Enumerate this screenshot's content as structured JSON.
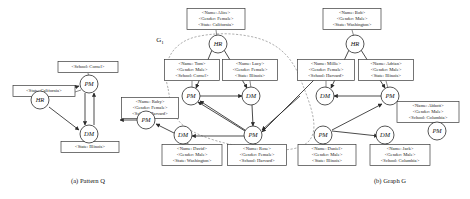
{
  "figure": {
    "panels": [
      {
        "id": "pattern",
        "caption": "(a) Pattern Q"
      },
      {
        "id": "graph",
        "caption": "(b) Graph G"
      }
    ],
    "region_label": "G",
    "region_label_sub": "1"
  },
  "pattern": {
    "nodes": [
      {
        "id": "p_hr",
        "label": "HR",
        "cx": 40,
        "cy": 100
      },
      {
        "id": "p_pm",
        "label": "PM",
        "cx": 89,
        "cy": 84
      },
      {
        "id": "p_dm",
        "label": "DM",
        "cx": 89,
        "cy": 134
      }
    ],
    "boxes": [
      {
        "id": "p_box_school",
        "cx": 88,
        "cy": 67,
        "w": 60,
        "h": 11,
        "lines": [
          "<School: Cornel>"
        ]
      },
      {
        "id": "p_box_state_ca",
        "cx": 44,
        "cy": 91,
        "w": 62,
        "h": 11,
        "lines": [
          "<State: California>"
        ]
      },
      {
        "id": "p_box_state_il",
        "cx": 90,
        "cy": 147,
        "w": 58,
        "h": 11,
        "lines": [
          "<State: Illinois>"
        ]
      }
    ]
  },
  "graph": {
    "nodes": [
      {
        "id": "g_hr1",
        "label": "HR",
        "sub": "",
        "cx": 218,
        "cy": 44
      },
      {
        "id": "g_pm1",
        "label": "PM",
        "sub": "",
        "cx": 191,
        "cy": 96
      },
      {
        "id": "g_dm1",
        "label": "DM",
        "sub": "",
        "cx": 251,
        "cy": 96
      },
      {
        "id": "g_pm2",
        "label": "PM",
        "sub": "",
        "cx": 253,
        "cy": 135
      },
      {
        "id": "g_dm2",
        "label": "DM",
        "sub": "",
        "cx": 183,
        "cy": 135
      },
      {
        "id": "g_pm3",
        "label": "PM",
        "sub": "",
        "cx": 146,
        "cy": 120
      },
      {
        "id": "g_hr2",
        "label": "HR",
        "sub": "",
        "cx": 355,
        "cy": 44
      },
      {
        "id": "g_dm3",
        "label": "DM",
        "sub": "",
        "cx": 325,
        "cy": 96
      },
      {
        "id": "g_pm4",
        "label": "PM",
        "sub": "",
        "cx": 390,
        "cy": 96
      },
      {
        "id": "g_pm5",
        "label": "PM",
        "sub": "",
        "cx": 323,
        "cy": 135
      },
      {
        "id": "g_dm4",
        "label": "DM",
        "sub": "",
        "cx": 385,
        "cy": 135
      },
      {
        "id": "g_pm6",
        "label": "PM",
        "sub": "",
        "cx": 437,
        "cy": 131
      }
    ],
    "boxes": [
      {
        "id": "g_box_alice",
        "cx": 216,
        "cy": 19,
        "w": 58,
        "h": 21,
        "lines": [
          "<Name: Alice>",
          "<Gender: Female>",
          "<State: California>"
        ]
      },
      {
        "id": "g_box_tom",
        "cx": 192,
        "cy": 70,
        "w": 55,
        "h": 21,
        "lines": [
          "<Name: Tom>",
          "<Gender: Male>",
          "<School: Cornel>"
        ]
      },
      {
        "id": "g_box_lucy",
        "cx": 250,
        "cy": 70,
        "w": 55,
        "h": 21,
        "lines": [
          "<Name: Lucy>",
          "<Gender: Female>",
          "<State: Illinois>"
        ]
      },
      {
        "id": "g_box_ruby",
        "cx": 150,
        "cy": 108,
        "w": 57,
        "h": 21,
        "lines": [
          "<Name: Ruby>",
          "<Gender: Female>",
          "<School: Harvard>"
        ]
      },
      {
        "id": "g_box_david",
        "cx": 192,
        "cy": 155,
        "w": 60,
        "h": 21,
        "lines": [
          "<Name: David>",
          "<Gender: Male>",
          "<State: Washington>"
        ]
      },
      {
        "id": "g_box_rose",
        "cx": 257,
        "cy": 155,
        "w": 59,
        "h": 21,
        "lines": [
          "<Name: Rose>",
          "<Gender: Female>",
          "<School: Harvard>"
        ]
      },
      {
        "id": "g_box_bob",
        "cx": 352,
        "cy": 19,
        "w": 58,
        "h": 21,
        "lines": [
          "<Name: Bob>",
          "<Gender: Male>",
          "<State: Washington>"
        ]
      },
      {
        "id": "g_box_millie",
        "cx": 326,
        "cy": 70,
        "w": 57,
        "h": 21,
        "lines": [
          "<Name: Millie>",
          "<Gender: Female>",
          "<School: Harvard>"
        ]
      },
      {
        "id": "g_box_adrian",
        "cx": 386,
        "cy": 70,
        "w": 55,
        "h": 21,
        "lines": [
          "<Name: Adrian>",
          "<Gender: Male>",
          "<State: Illinois>"
        ]
      },
      {
        "id": "g_box_abbott",
        "cx": 428,
        "cy": 112,
        "w": 62,
        "h": 21,
        "lines": [
          "<Name: Abbott>",
          "<Gender: Male>",
          "<School: Columbia>"
        ]
      },
      {
        "id": "g_box_daniel",
        "cx": 327,
        "cy": 155,
        "w": 58,
        "h": 21,
        "lines": [
          "<Name: Daniel>",
          "<Gender: Male>",
          "<State: Illinois>"
        ]
      },
      {
        "id": "g_box_jack",
        "cx": 400,
        "cy": 155,
        "w": 60,
        "h": 21,
        "lines": [
          "<Name: Jack>",
          "<Gender: Male>",
          "<School: Columbia>"
        ]
      }
    ]
  }
}
